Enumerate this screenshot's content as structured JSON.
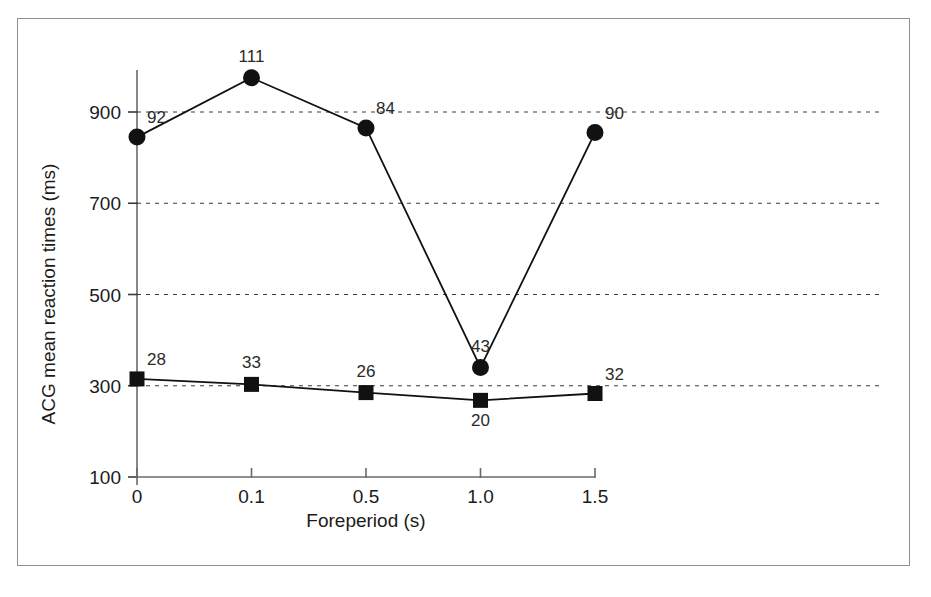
{
  "figure": {
    "frame_color": "#8e8e8e",
    "background": "#ffffff",
    "ink_color": "#111111"
  },
  "chart_data": {
    "type": "line",
    "title": "",
    "subtitle": "",
    "xlabel": "Foreperiod (s)",
    "ylabel": "ACG mean reaction times (ms)",
    "categories": [
      "0",
      "0.1",
      "0.5",
      "1.0",
      "1.5"
    ],
    "x_tick_labels": [
      "0",
      "0.1",
      "0.5",
      "1.0",
      "1.5"
    ],
    "y_tick_labels": [
      "100",
      "300",
      "500",
      "700",
      "900"
    ],
    "y_ticks": [
      100,
      300,
      500,
      700,
      900
    ],
    "ylim": [
      100,
      1000
    ],
    "grid": "horizontal-dashed",
    "gridlines_at": [
      300,
      500,
      700,
      900
    ],
    "legend": "none",
    "series": [
      {
        "name": "circle-series",
        "marker": "circle",
        "values": [
          845,
          975,
          865,
          340,
          855
        ],
        "point_labels": [
          "92",
          "111",
          "84",
          "43",
          "90"
        ],
        "label_positions": [
          "above-right",
          "above",
          "above-right",
          "above",
          "above-right"
        ]
      },
      {
        "name": "square-series",
        "marker": "square",
        "values": [
          315,
          303,
          285,
          268,
          283
        ],
        "point_labels": [
          "28",
          "33",
          "26",
          "20",
          "32"
        ],
        "label_positions": [
          "above-right",
          "above",
          "above",
          "below",
          "above-right"
        ]
      }
    ]
  }
}
